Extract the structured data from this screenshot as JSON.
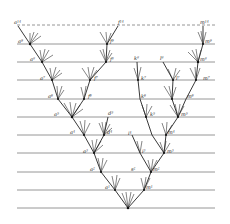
{
  "figure": {
    "type": "phylogenetic divergence diagram",
    "grid_lines_y": [
      25,
      44,
      62,
      80,
      99,
      117,
      135,
      153,
      172,
      190,
      208
    ],
    "grid_x": [
      17,
      215
    ],
    "root": {
      "x": 128,
      "y": 208
    },
    "labels": [
      {
        "id": "a14",
        "text": "a¹⁴",
        "x": 14,
        "y": 24
      },
      {
        "id": "a9",
        "text": "a⁹",
        "x": 18,
        "y": 43
      },
      {
        "id": "a8",
        "text": "a⁸",
        "x": 30,
        "y": 61
      },
      {
        "id": "a7",
        "text": "a⁷",
        "x": 38,
        "y": 80
      },
      {
        "id": "a6",
        "text": "a⁶",
        "x": 46,
        "y": 98
      },
      {
        "id": "a5",
        "text": "a⁵",
        "x": 52,
        "y": 116
      },
      {
        "id": "a4",
        "text": "a⁴",
        "x": 66,
        "y": 134
      },
      {
        "id": "a3",
        "text": "a³",
        "x": 80,
        "y": 153
      },
      {
        "id": "a2",
        "text": "a²",
        "x": 88,
        "y": 171
      },
      {
        "id": "a1",
        "text": "a¹",
        "x": 104,
        "y": 189
      },
      {
        "id": "f14",
        "text": "f¹⁴",
        "x": 118,
        "y": 24
      },
      {
        "id": "f9",
        "text": "f⁹",
        "x": 110,
        "y": 43
      },
      {
        "id": "f8",
        "text": "f⁸",
        "x": 110,
        "y": 61
      },
      {
        "id": "f7",
        "text": "f⁷",
        "x": 94,
        "y": 80
      },
      {
        "id": "f6",
        "text": "f⁶",
        "x": 88,
        "y": 98
      },
      {
        "id": "d5",
        "text": "d⁵",
        "x": 108,
        "y": 115
      },
      {
        "id": "d4",
        "text": "d⁴",
        "x": 106,
        "y": 134
      },
      {
        "id": "k8",
        "text": "k⁸",
        "x": 136,
        "y": 60
      },
      {
        "id": "k7",
        "text": "k⁷",
        "x": 141,
        "y": 80
      },
      {
        "id": "k6",
        "text": "k⁶",
        "x": 141,
        "y": 98
      },
      {
        "id": "k5",
        "text": "k⁵",
        "x": 150,
        "y": 116
      },
      {
        "id": "l8",
        "text": "l⁸",
        "x": 162,
        "y": 60
      },
      {
        "id": "l7",
        "text": "l⁷",
        "x": 176,
        "y": 80
      },
      {
        "id": "i4",
        "text": "i⁴",
        "x": 128,
        "y": 135
      },
      {
        "id": "i3",
        "text": "i³",
        "x": 142,
        "y": 153
      },
      {
        "id": "s2",
        "text": "s²",
        "x": 131,
        "y": 171
      },
      {
        "id": "m14",
        "text": "m¹⁴",
        "x": 201,
        "y": 24
      },
      {
        "id": "m9",
        "text": "m⁹",
        "x": 203,
        "y": 43
      },
      {
        "id": "m8",
        "text": "m⁸",
        "x": 198,
        "y": 61
      },
      {
        "id": "m7",
        "text": "m⁷",
        "x": 204,
        "y": 80
      },
      {
        "id": "m6",
        "text": "m⁶",
        "x": 186,
        "y": 98
      },
      {
        "id": "m5",
        "text": "m⁵",
        "x": 181,
        "y": 116
      },
      {
        "id": "m4",
        "text": "m⁴",
        "x": 171,
        "y": 134
      },
      {
        "id": "m3",
        "text": "m³",
        "x": 168,
        "y": 153
      },
      {
        "id": "m2",
        "text": "m²",
        "x": 153,
        "y": 171
      },
      {
        "id": "m1",
        "text": "m¹",
        "x": 144,
        "y": 189
      }
    ]
  }
}
